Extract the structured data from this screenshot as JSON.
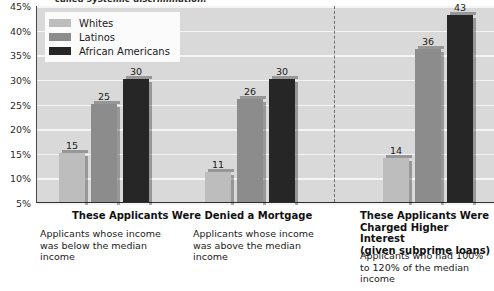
{
  "caption_clipped": "called systemic discrimination.",
  "chart_data": {
    "type": "bar",
    "title": "",
    "xlabel": "",
    "ylabel": "",
    "ylim": [
      5,
      45
    ],
    "y_tick_labels": [
      "45%",
      "40%",
      "35%",
      "30%",
      "25%",
      "20%",
      "15%",
      "10%",
      "5%"
    ],
    "y_tick_values": [
      45,
      40,
      35,
      30,
      25,
      20,
      15,
      10,
      5
    ],
    "grid": true,
    "legend_position": "top-left",
    "categories": [
      "Applicants whose income was below the median income",
      "Applicants whose income was above the median income",
      "Applicants who had 100% to 120% of the median income"
    ],
    "series": [
      {
        "name": "Whites",
        "color": "#bdbdbd",
        "values": [
          15,
          11,
          14
        ]
      },
      {
        "name": "Latinos",
        "color": "#8c8c8c",
        "values": [
          25,
          26,
          36
        ]
      },
      {
        "name": "African Americans",
        "color": "#262626",
        "values": [
          30,
          30,
          43
        ]
      }
    ],
    "sections": [
      {
        "title": "These Applicants Were Denied a Mortgage"
      },
      {
        "title": "These Applicants Were Charged Higher Interest (given subprime loans)"
      }
    ],
    "annotations": [
      "15",
      "25",
      "30",
      "11",
      "26",
      "30",
      "14",
      "36",
      "43"
    ]
  },
  "legend": {
    "items": [
      {
        "label": "Whites"
      },
      {
        "label": "Latinos"
      },
      {
        "label": "African Americans"
      }
    ]
  },
  "sections": {
    "left_title": "These Applicants Were Denied a Mortgage",
    "right_title_line1": "These Applicants Were",
    "right_title_line2": "Charged Higher Interest",
    "right_title_line3": "(given subprime loans)",
    "sub1": "Applicants whose income was below the median income",
    "sub2": "Applicants whose income was above the median income",
    "sub3": "Applicants who had 100% to 120% of the median income"
  }
}
